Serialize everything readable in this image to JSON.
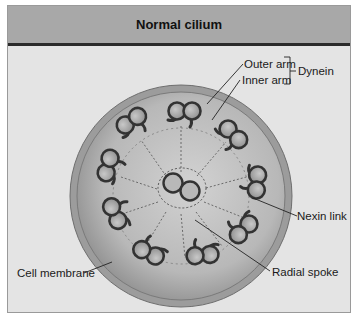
{
  "header": {
    "title": "Normal cilium"
  },
  "labels": {
    "outer_arm": "Outer arm",
    "inner_arm": "Inner arm",
    "dynein": "Dynein",
    "nexin_link": "Nexin link",
    "radial_spoke": "Radial spoke",
    "cell_membrane": "Cell membrane"
  },
  "structure": {
    "outer_doublets": 9,
    "central_pair": 2,
    "arrangement": "9+2"
  },
  "colors": {
    "header_bg": "#a8a8a8",
    "frame_bg": "#e4e4e4",
    "membrane": "#8f8f8f",
    "cytoplasm_dark": "#9a9a9a",
    "cytoplasm_light": "#cfcfcf",
    "tubule_stroke": "#333333"
  }
}
